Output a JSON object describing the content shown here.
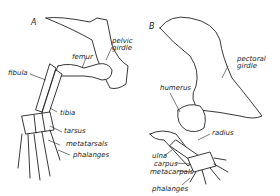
{
  "figure": {
    "panels": [
      {
        "id": "A",
        "label": "A",
        "subject": "hind limb",
        "labels": {
          "pelvic_girdle": "pelvic\ngirdle",
          "femur": "femur",
          "fibula": "fibula",
          "tibia": "tibia",
          "tarsus": "tarsus",
          "metatarsals": "metatarsals",
          "phalanges": "phalanges"
        }
      },
      {
        "id": "B",
        "label": "B",
        "subject": "fore limb",
        "labels": {
          "pectoral_girdle": "pectoral\ngirdle",
          "humerus": "humerus",
          "radius": "radius",
          "ulna": "ulna",
          "carpus": "carpus",
          "metacarpals": "metacarpals",
          "phalanges": "phalanges"
        }
      }
    ]
  }
}
